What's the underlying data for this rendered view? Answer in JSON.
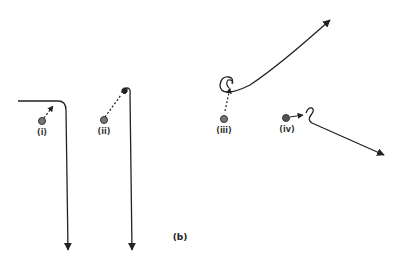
{
  "figure": {
    "label": "(b)",
    "panels": [
      {
        "id": "i",
        "label": "(i)"
      },
      {
        "id": "ii",
        "label": "(ii)"
      },
      {
        "id": "iii",
        "label": "(iii)"
      },
      {
        "id": "iv",
        "label": "(iv)"
      }
    ]
  },
  "colors": {
    "line": "#222222",
    "dot_fill": "#777777",
    "dot_stroke": "#333333",
    "background": "#ffffff"
  }
}
